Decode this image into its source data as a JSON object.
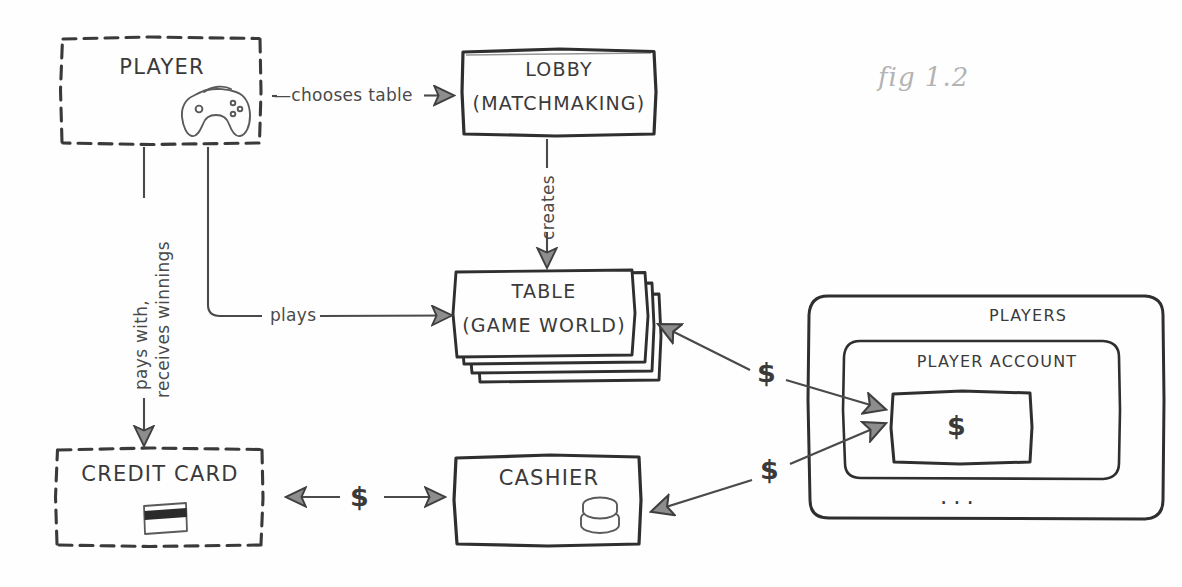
{
  "figure": {
    "caption": "fig 1.2",
    "ink_color": "#3a3a3a",
    "caption_color": "#b3b3b3",
    "background": "#fefefe"
  },
  "nodes": {
    "player": {
      "label": "PLAYER",
      "icon": "game-controller-icon",
      "border_style": "dashed"
    },
    "lobby": {
      "line1": "LOBBY",
      "line2": "(MATCHMAKING)",
      "border_style": "solid"
    },
    "table": {
      "line1": "TABLE",
      "line2": "(GAME WORLD)",
      "border_style": "solid-stacked",
      "stack_count": 3
    },
    "credit_card": {
      "label": "CREDIT CARD",
      "icon": "credit-card-icon",
      "border_style": "dashed"
    },
    "cashier": {
      "label": "CASHIER",
      "icon": "coin-stack-icon",
      "border_style": "solid"
    },
    "players": {
      "label": "PLAYERS",
      "border_style": "solid-rounded"
    },
    "player_account": {
      "label": "PLAYER ACCOUNT",
      "border_style": "solid-rounded"
    },
    "account_balance": {
      "label": "$",
      "border_style": "solid"
    },
    "more_accounts": {
      "label": "..."
    }
  },
  "edges": {
    "chooses_table": {
      "label": "—chooses table",
      "from": "player",
      "to": "lobby"
    },
    "creates": {
      "label": "creates",
      "from": "lobby",
      "to": "table"
    },
    "plays": {
      "label": "plays",
      "from": "player",
      "to": "table"
    },
    "pays_with": {
      "label_line1": "pays with,",
      "label_line2": "receives winnings",
      "from": "player",
      "to": "credit_card"
    },
    "card_cashier": {
      "label": "$",
      "from": "credit_card",
      "to": "cashier"
    },
    "table_account": {
      "label": "$",
      "from": "table",
      "to": "account_balance"
    },
    "cashier_account": {
      "label": "$",
      "from": "cashier",
      "to": "account_balance"
    }
  }
}
